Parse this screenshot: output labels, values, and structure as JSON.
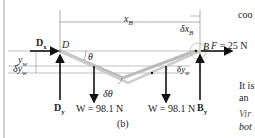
{
  "figure": {
    "caption": "(b)",
    "labels": {
      "xB": "x",
      "xB_sub": "B",
      "dxB": "δx",
      "dxB_sub": "B",
      "D": "D",
      "B": "B",
      "Dx": "D",
      "Dx_sub": "x",
      "Dy": "D",
      "Dy_sub": "y",
      "By": "B",
      "By_sub": "y",
      "theta": "θ",
      "dtheta": "δθ",
      "yw": "y",
      "yw_sub": "w",
      "dyw_left": "δy",
      "dyw_left_sub": "w",
      "dyw_right": "δy",
      "dyw_right_sub": "w",
      "F": "F = 25 N",
      "W_left": "W = 98.1 N",
      "W_right": "W = 98.1 N"
    }
  },
  "side_text": {
    "line1": "coo",
    "line2": "It is",
    "line3": "an",
    "line4": "Vir",
    "line5": "bot"
  }
}
